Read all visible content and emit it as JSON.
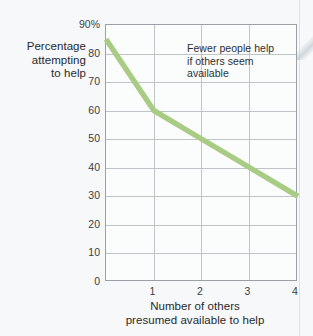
{
  "figure": {
    "y_axis_title_lines": [
      "Percentage",
      "attempting",
      "to help"
    ],
    "x_axis_title_lines": [
      "Number of others",
      "presumed available to help"
    ],
    "annotation_lines": [
      "Fewer people help",
      "if others seem",
      "available"
    ]
  },
  "colors": {
    "series_line": "#a8cc84",
    "gridline": "#bfc4c8",
    "plot_border": "#9aa0a5",
    "background": "#f6f8f9",
    "plot_background": "#fbfcfc",
    "text": "#262a2d",
    "tick_text": "#3a3f43"
  },
  "chart_data": {
    "type": "line",
    "title": "",
    "subtitle": "",
    "xlabel": "Number of others presumed available to help",
    "ylabel": "Percentage attempting to help",
    "x": [
      0,
      1,
      2,
      3,
      4
    ],
    "values": [
      85,
      60,
      50,
      40,
      30
    ],
    "series": [
      {
        "name": "Percentage attempting to help",
        "values": [
          85,
          60,
          50,
          40,
          30
        ]
      }
    ],
    "xlim": [
      0,
      4
    ],
    "ylim": [
      0,
      90
    ],
    "yticks": [
      0,
      10,
      20,
      30,
      40,
      50,
      60,
      70,
      80,
      90
    ],
    "ytick_labels": [
      "0",
      "10",
      "20",
      "30",
      "40",
      "50",
      "60",
      "70",
      "80",
      "90%"
    ],
    "xticks": [
      1,
      2,
      3,
      4
    ],
    "xtick_labels": [
      "1",
      "2",
      "3",
      "4"
    ],
    "grid": true,
    "grid_axes": "both",
    "legend": false,
    "legend_position": "none",
    "annotations": [
      {
        "text": "Fewer people help if others seem available",
        "x": 2.0,
        "y": 84
      }
    ]
  }
}
